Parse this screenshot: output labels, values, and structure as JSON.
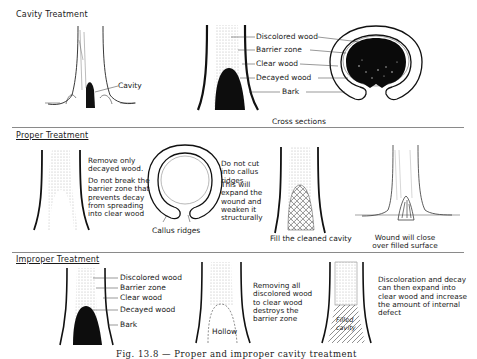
{
  "sections": {
    "cavity": {
      "title": "Cavity Treatment",
      "tree_label": "Cavity",
      "stem_labels": [
        "Discolored wood",
        "Barrier zone",
        "Clear wood",
        "Decayed wood",
        "Bark"
      ],
      "cross_sections_label": "Cross sections"
    },
    "proper": {
      "title": "Proper Treatment",
      "note1": "Remove only decayed wood.",
      "note2": "Do not break the barrier zone that prevents decay from spreading into clear wood",
      "callus_label": "Callus ridges",
      "note3": "Do not cut into callus ridges",
      "note4": "This will expand the wound and weaken it structurally",
      "fill_label": "Fill the cleaned cavity",
      "close_label": "Wound will close over filled surface"
    },
    "improper": {
      "title": "Improper Treatment",
      "stem_labels": [
        "Discolored wood",
        "Barrier zone",
        "Clear wood",
        "Decayed wood",
        "Bark"
      ],
      "hollow_label": "Hollow",
      "note1": "Removing all discolored wood to clear wood destroys the barrier zone",
      "filled_label": "Filled cavity",
      "note2": "Discoloration and decay can then expand into clear wood and increase the amount of internal defect"
    }
  },
  "caption": "Fig. 13.8 — Proper and improper cavity treatment"
}
